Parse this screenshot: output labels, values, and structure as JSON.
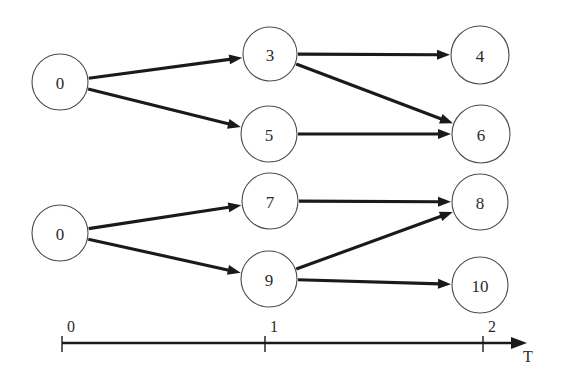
{
  "figure": {
    "background_color": "#ffffff",
    "width": 562,
    "height": 385,
    "stroke_color": "#1a1a1a",
    "node_stroke_color": "#4c4c4c",
    "node_fill_color": "#ffffff",
    "text_color": "#2b2b2b"
  },
  "chart_data": {
    "type": "diagram",
    "subtype": "directed-acyclic-graph-timeline",
    "title": "",
    "xlabel": "T",
    "ylabel": "",
    "grid": false,
    "legend": null,
    "axis": {
      "name": "T",
      "orientation": "horizontal",
      "y": 343,
      "x_start": 62,
      "x_end": 527,
      "arrow": true,
      "ticks": [
        {
          "label": "0",
          "x": 62
        },
        {
          "label": "1",
          "x": 265
        },
        {
          "label": "2",
          "x": 483
        }
      ],
      "tick_label_y": 332,
      "tick_top": 336,
      "tick_bottom": 352,
      "name_label_x": 528,
      "name_label_y": 362
    },
    "nodes": [
      {
        "id": "n0a",
        "label": "0",
        "cx": 60,
        "cy": 82,
        "r": 28,
        "time": 0
      },
      {
        "id": "n3",
        "label": "3",
        "cx": 270,
        "cy": 54,
        "r": 27,
        "time": 1
      },
      {
        "id": "n5",
        "label": "5",
        "cx": 269,
        "cy": 134,
        "r": 28,
        "time": 1
      },
      {
        "id": "n4",
        "label": "4",
        "cx": 480,
        "cy": 55,
        "r": 29,
        "time": 2
      },
      {
        "id": "n6",
        "label": "6",
        "cx": 481,
        "cy": 134,
        "r": 29,
        "time": 2
      },
      {
        "id": "n0b",
        "label": "0",
        "cx": 60,
        "cy": 233,
        "r": 28,
        "time": 0
      },
      {
        "id": "n7",
        "label": "7",
        "cx": 270,
        "cy": 201,
        "r": 28,
        "time": 1
      },
      {
        "id": "n9",
        "label": "9",
        "cx": 269,
        "cy": 279,
        "r": 28,
        "time": 1
      },
      {
        "id": "n8",
        "label": "8",
        "cx": 480,
        "cy": 202,
        "r": 28,
        "time": 2
      },
      {
        "id": "n10",
        "label": "10",
        "cx": 480,
        "cy": 285,
        "r": 28,
        "time": 2
      }
    ],
    "edges": [
      {
        "from": "n0a",
        "to": "n3",
        "directed": true
      },
      {
        "from": "n0a",
        "to": "n5",
        "directed": true
      },
      {
        "from": "n3",
        "to": "n4",
        "directed": true
      },
      {
        "from": "n3",
        "to": "n6",
        "directed": true
      },
      {
        "from": "n5",
        "to": "n6",
        "directed": true
      },
      {
        "from": "n0b",
        "to": "n7",
        "directed": true
      },
      {
        "from": "n0b",
        "to": "n9",
        "directed": true
      },
      {
        "from": "n7",
        "to": "n8",
        "directed": true
      },
      {
        "from": "n9",
        "to": "n8",
        "directed": true
      },
      {
        "from": "n9",
        "to": "n10",
        "directed": true
      }
    ],
    "edge_style": {
      "stroke_width": 3.1,
      "arrow_length": 13,
      "arrow_half_width": 5
    }
  }
}
